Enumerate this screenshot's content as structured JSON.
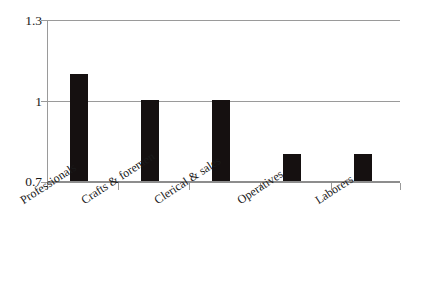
{
  "chart_data": {
    "type": "bar",
    "title": "",
    "subtitle": "",
    "xlabel": "",
    "ylabel": "",
    "categories": [
      "Professionals",
      "Crafts & foremen",
      "Clerical & sales",
      "Operatives",
      "Laborers"
    ],
    "values": [
      1.1,
      1.0,
      1.0,
      0.8,
      0.8
    ],
    "ylim": [
      0.7,
      1.3
    ],
    "yticks": [
      0.7,
      1.0,
      1.3
    ],
    "ytick_labels": [
      "0.7",
      "1",
      "1.3"
    ],
    "grid": true,
    "legend": false,
    "legend_position": "none",
    "bar_color": "#151010",
    "grid_color": "#9a9a9a",
    "background": "#ffffff",
    "annotations": []
  },
  "axes": {
    "y": {
      "top_label": "1.3",
      "mid_label": "1",
      "bottom_label": "0.7"
    },
    "x": {
      "labels": [
        "Professionals",
        "Crafts & foremen",
        "Clerical & sales",
        "Operatives",
        "Laborers"
      ]
    }
  }
}
